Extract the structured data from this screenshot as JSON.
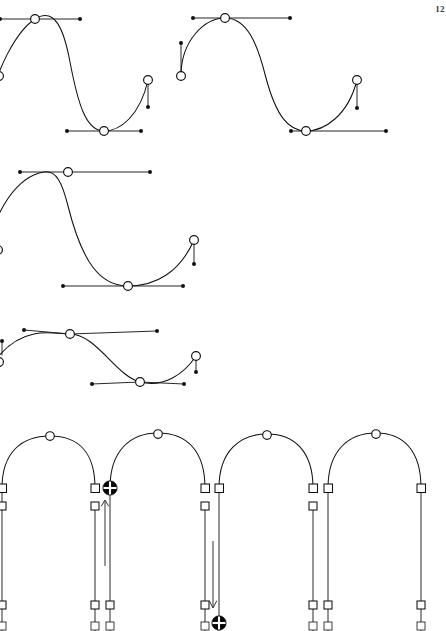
{
  "page": {
    "folio": "12",
    "width": 446,
    "height": 631,
    "background": "#ffffff",
    "ink_color": "#111111",
    "marker_color": "#060606",
    "marker_cross_color": "#ffffff"
  },
  "figures": [
    {
      "id": "figure-row-1-left",
      "name": "bezier-s-curve-clipped-left",
      "description": "S-shaped Bezier curve clipped at the left page edge, peak anchor near top, valley anchor at bottom, end anchor at right with vertical handle"
    },
    {
      "id": "figure-row-1-right",
      "name": "bezier-s-curve-full",
      "description": "Complete S-shaped Bezier curve beginning at a low-left anchor with vertical handle, rising to a peak anchor, descending to a valley anchor, ending at right anchor with vertical handle"
    },
    {
      "id": "figure-row-2",
      "name": "bezier-s-curve-wide",
      "description": "Wide shallow S-curve with peak anchor upper-left, valley anchor lower-right and terminal anchor with short vertical handle"
    },
    {
      "id": "figure-row-3",
      "name": "bezier-s-curve-flat",
      "description": "Flattened S-curve variant with reduced amplitude, peak anchor upper-left, valley anchor lower-right"
    },
    {
      "id": "figure-row-4",
      "name": "arch-series-with-extension-markers",
      "description": "Row of four arch (inverted U) outlines with apex anchors, square base anchors, vertical stems and extension arrows showing a point being dragged"
    }
  ],
  "glyph_legend": [
    {
      "key": "anchor-circle",
      "label": "anchor point",
      "shape": "open circle"
    },
    {
      "key": "control-dot",
      "label": "control handle endpoint",
      "shape": "filled dot"
    },
    {
      "key": "handle-line",
      "label": "control handle arm",
      "shape": "thin line"
    },
    {
      "key": "anchor-square",
      "label": "corner anchor point",
      "shape": "open square"
    },
    {
      "key": "selected-marker",
      "label": "selected / target point",
      "shape": "filled circle with white cross"
    },
    {
      "key": "drag-arrow-up",
      "label": "drag direction up",
      "shape": "arrow"
    },
    {
      "key": "drag-arrow-down",
      "label": "drag direction down",
      "shape": "arrow"
    }
  ],
  "geometry": {
    "row1_left": {
      "curve": "M -14 118 C -4 66 18 30 35 19 C 55 6 64 30 70 62 C 78 104 86 131 104 131 C 120 131 140 116 148 80",
      "handles": [
        {
          "from": [
            35,
            19
          ],
          "to": [
            0,
            19
          ],
          "dot": [
            0,
            19
          ]
        },
        {
          "from": [
            35,
            19
          ],
          "to": [
            80,
            19
          ],
          "dot": [
            80,
            19
          ]
        },
        {
          "from": [
            104,
            131
          ],
          "to": [
            67,
            131
          ],
          "dot": [
            67,
            131
          ]
        },
        {
          "from": [
            104,
            131
          ],
          "to": [
            141,
            131
          ],
          "dot": [
            141,
            131
          ]
        },
        {
          "from": [
            148,
            80
          ],
          "to": [
            148,
            107
          ],
          "dot": [
            148,
            107
          ]
        }
      ],
      "anchors": [
        [
          35,
          19
        ],
        [
          104,
          131
        ],
        [
          148,
          80
        ]
      ],
      "edge_anchor": [
        0,
        76
      ]
    },
    "row1_right": {
      "curve": "M 181 76 C 181 40 205 18 225 18 C 248 18 258 46 266 78 C 276 115 288 131 306 131 C 324 131 348 116 357 80",
      "handles": [
        {
          "from": [
            181,
            76
          ],
          "to": [
            181,
            43
          ],
          "dot": [
            181,
            43
          ]
        },
        {
          "from": [
            225,
            18
          ],
          "to": [
            193,
            18
          ],
          "dot": [
            193,
            18
          ]
        },
        {
          "from": [
            225,
            18
          ],
          "to": [
            290,
            18
          ],
          "dot": [
            290,
            18
          ]
        },
        {
          "from": [
            306,
            131
          ],
          "to": [
            291,
            131
          ],
          "dot": [
            291,
            131
          ]
        },
        {
          "from": [
            306,
            131
          ],
          "to": [
            386,
            131
          ],
          "dot": [
            386,
            131
          ]
        },
        {
          "from": [
            357,
            80
          ],
          "to": [
            357,
            108
          ],
          "dot": [
            357,
            108
          ]
        }
      ],
      "anchors": [
        [
          181,
          76
        ],
        [
          225,
          18
        ],
        [
          306,
          131
        ],
        [
          357,
          80
        ]
      ]
    },
    "row2": {
      "curve": "M -12 252 C -6 210 18 176 44 172 C 56 170 62 182 68 206 C 82 262 100 286 128 286 C 156 286 180 272 194 240",
      "handles": [
        {
          "from": [
            68,
            172
          ],
          "to": [
            20,
            172
          ],
          "dot": [
            20,
            172
          ]
        },
        {
          "from": [
            68,
            172
          ],
          "to": [
            150,
            172
          ],
          "dot": [
            150,
            172
          ]
        },
        {
          "from": [
            128,
            286
          ],
          "to": [
            63,
            286
          ],
          "dot": [
            63,
            286
          ]
        },
        {
          "from": [
            128,
            286
          ],
          "to": [
            183,
            286
          ],
          "dot": [
            183,
            286
          ]
        },
        {
          "from": [
            194,
            240
          ],
          "to": [
            194,
            264
          ],
          "dot": [
            194,
            264
          ]
        }
      ],
      "anchors": [
        [
          68,
          172
        ],
        [
          128,
          286
        ],
        [
          194,
          240
        ]
      ]
    },
    "row3": {
      "curve": "M -10 366 C 2 350 20 336 40 333 C 54 331 62 334 70 334 C 96 334 118 376 140 382 C 164 388 184 374 196 356",
      "handles": [
        {
          "from": [
            70,
            334
          ],
          "to": [
            24,
            330
          ],
          "dot": [
            24,
            330
          ]
        },
        {
          "from": [
            70,
            334
          ],
          "to": [
            157,
            331
          ],
          "dot": [
            157,
            331
          ]
        },
        {
          "from": [
            140,
            382
          ],
          "to": [
            92,
            384
          ],
          "dot": [
            92,
            384
          ]
        },
        {
          "from": [
            140,
            382
          ],
          "to": [
            184,
            384
          ],
          "dot": [
            184,
            384
          ]
        },
        {
          "from": [
            196,
            356
          ],
          "to": [
            196,
            372
          ],
          "dot": [
            196,
            372
          ]
        }
      ],
      "anchors": [
        [
          70,
          334
        ],
        [
          140,
          382
        ],
        [
          196,
          356
        ]
      ]
    },
    "arches": [
      {
        "apex": [
          52,
          440
        ],
        "left_base": [
          2,
          488
        ],
        "right_base": [
          95,
          488
        ]
      },
      {
        "apex": [
          159,
          437
        ],
        "left_base": [
          110,
          488
        ],
        "right_base": [
          205,
          488
        ]
      },
      {
        "apex": [
          267,
          438
        ],
        "left_base": [
          219,
          488
        ],
        "right_base": [
          313,
          488
        ]
      },
      {
        "apex": [
          376,
          437
        ],
        "left_base": [
          328,
          488
        ],
        "right_base": [
          421,
          488
        ]
      }
    ],
    "stems": [
      {
        "x": 2,
        "from": 488,
        "to": 631,
        "square_y": 506
      },
      {
        "x": 95,
        "from": 488,
        "to": 631,
        "square_y": 506
      },
      {
        "x": 110,
        "from": 488,
        "to": 631,
        "square_y": null
      },
      {
        "x": 205,
        "from": 488,
        "to": 631,
        "square_y": 506
      },
      {
        "x": 219,
        "from": 488,
        "to": 631,
        "square_y": null
      },
      {
        "x": 313,
        "from": 488,
        "to": 631,
        "square_y": 506
      },
      {
        "x": 328,
        "from": 488,
        "to": 631,
        "square_y": null
      },
      {
        "x": 421,
        "from": 488,
        "to": 631,
        "square_y": null
      }
    ],
    "markers": [
      {
        "at": [
          110,
          488
        ],
        "type": "selected-marker"
      },
      {
        "at": [
          219,
          622
        ],
        "type": "selected-marker"
      }
    ],
    "arrows": [
      {
        "from": [
          105,
          560
        ],
        "to": [
          105,
          500
        ],
        "direction": "up"
      },
      {
        "from": [
          213,
          545
        ],
        "to": [
          213,
          607
        ],
        "direction": "down"
      }
    ]
  }
}
